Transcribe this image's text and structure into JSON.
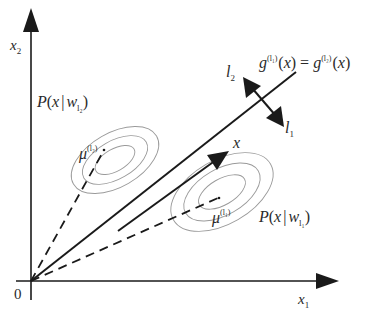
{
  "figure": {
    "type": "diagram",
    "colors": {
      "ink": "#1a1a1a",
      "contour": "#9a9a9a",
      "background": "#ffffff"
    }
  },
  "axes": {
    "origin_label": "0",
    "x_label": {
      "base": "x",
      "sub": "1"
    },
    "y_label": {
      "base": "x",
      "sub": "2"
    }
  },
  "boundary": {
    "label": {
      "lhs_base": "g",
      "lhs_sup": "(l₁)",
      "lhs_arg": "(x)",
      "eq": "=",
      "rhs_base": "g",
      "rhs_sup": "(l₂)",
      "rhs_arg": "(x)"
    }
  },
  "normal_arrows": {
    "l1": {
      "base": "l",
      "sub": "1"
    },
    "l2": {
      "base": "l",
      "sub": "2"
    }
  },
  "vector": {
    "label": "x"
  },
  "classes": [
    {
      "id": "l2",
      "density_label": {
        "prefix": "P(",
        "var": "x",
        "bar": "|",
        "w": "w",
        "sub": "l₂",
        "suffix": ")"
      },
      "mean_label": {
        "base": "μ",
        "sup": "(l₂)"
      }
    },
    {
      "id": "l1",
      "density_label": {
        "prefix": "P(",
        "var": "x",
        "bar": "|",
        "w": "w",
        "sub": "l₁",
        "suffix": ")"
      },
      "mean_label": {
        "base": "μ",
        "sup": "(l₁)"
      }
    }
  ]
}
